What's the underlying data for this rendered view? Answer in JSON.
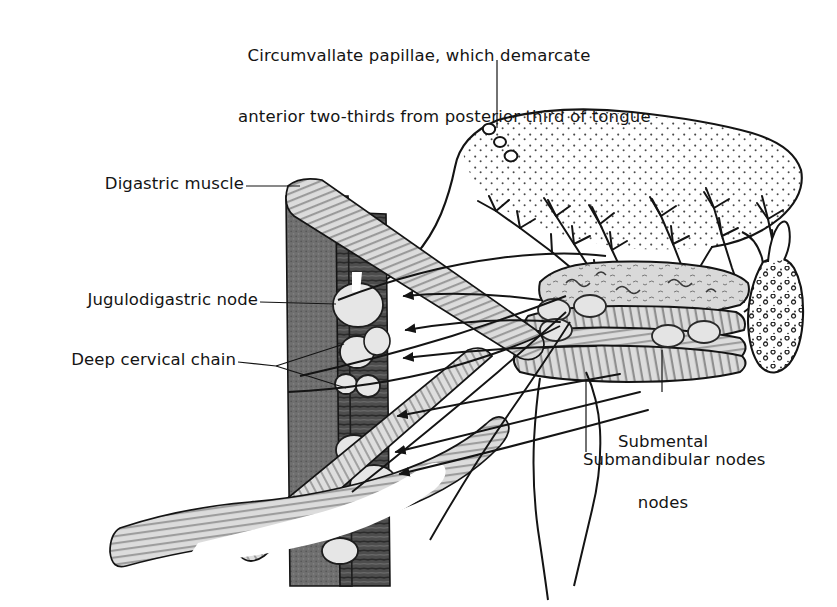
{
  "figure": {
    "kind": "anatomical-line-diagram",
    "background_color": "#ffffff",
    "ink_color": "#141414"
  },
  "title": {
    "line1": "Circumvallate papillae, which demarcate",
    "line2": "anterior two-thirds from posterior third of tongue"
  },
  "labels": {
    "digastric_muscle": "Digastric muscle",
    "jugulodigastric_node": "Jugulodigastric node",
    "deep_cervical_chain": "Deep cervical chain",
    "submental_nodes_line1": "Submental",
    "submental_nodes_line2": "nodes",
    "submandibular_nodes": "Submandibular nodes"
  },
  "structures": {
    "tongue": {
      "name": "tongue-dorsum",
      "fill": "#ffffff",
      "stipple": true,
      "stipple_color": "#3a3a3a"
    },
    "circumvallate_papillae": {
      "name": "circumvallate-papillae",
      "count": 3,
      "fill": "#ffffff",
      "stroke": "#141414"
    },
    "sternocleidomastoid": {
      "name": "sternocleidomastoid-muscle",
      "fill": "#6e6e6e",
      "texture": "stipple"
    },
    "internal_jugular_vein": {
      "name": "internal-jugular-vein",
      "fill": "#4a4a4a",
      "texture": "horizontal-striae"
    },
    "digastric_muscle_band": {
      "name": "digastric-muscle-band",
      "fill": "#d8d8d8",
      "texture": "parallel-striae"
    },
    "lymph_nodes": {
      "name": "lymph-node",
      "fill": "#e2e2e2",
      "stroke": "#2a2a2a",
      "count_deep_chain": 7
    },
    "submandibular_gland": {
      "name": "submandibular-gland",
      "fill": "#d6d6d6",
      "texture": "glandular"
    },
    "mylohyoid": {
      "name": "mylohyoid-muscle",
      "fill": "#d2d2d2",
      "texture": "vertical-striae"
    },
    "sublingual_gland": {
      "name": "sublingual-gland",
      "fill": "#ffffff",
      "texture": "acinar-speckle"
    },
    "lymphatic_vessels": {
      "name": "lymphatic-vessel",
      "stroke": "#141414",
      "branching": true
    },
    "drainage_arrows": {
      "name": "drainage-arrow",
      "count": 6,
      "direction": "toward-deep-cervical-chain"
    }
  }
}
